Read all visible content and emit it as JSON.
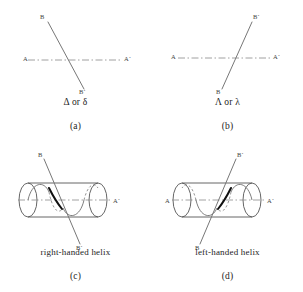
{
  "figure": {
    "domain": "diagram",
    "type": "chirality-convention-figure",
    "background": "#ffffff",
    "stroke_color": "#555555",
    "dash_color": "#777777",
    "bold_color": "#111111",
    "text_color": "#1d1d1d",
    "panels": [
      {
        "id": "a",
        "caption_name": "Δ or δ",
        "caption_letter": "(a)",
        "kind": "skew-lines",
        "labels": {
          "axis_left": "A",
          "axis_right": "A´",
          "line_top": "B",
          "line_bottom": "B´"
        },
        "description": "front line descends left-to-right over a horizontal dashed A-A´ axis"
      },
      {
        "id": "b",
        "caption_name": "Λ or λ",
        "caption_letter": "(b)",
        "kind": "skew-lines",
        "labels": {
          "axis_left": "A",
          "axis_right": "A´",
          "line_top": "B´",
          "line_bottom": "B"
        },
        "description": "front line ascends left-to-right over a horizontal dashed A-A´ axis"
      },
      {
        "id": "c",
        "caption_name": "right-handed helix",
        "caption_letter": "(c)",
        "kind": "cylinder-helix",
        "handedness": "right",
        "labels": {
          "axis_left": "A",
          "axis_right": "A´",
          "line_top": "B",
          "line_bottom": "B´"
        },
        "description": "helix drawn on a cylinder with dashed hidden back arcs and a bold front segment"
      },
      {
        "id": "d",
        "caption_name": "left-handed helix",
        "caption_letter": "(d)",
        "kind": "cylinder-helix",
        "handedness": "left",
        "labels": {
          "axis_left": "A",
          "axis_right": "A´",
          "line_top": "B´",
          "line_bottom": "B"
        },
        "description": "mirror-image helix on a cylinder with dashed hidden back arcs and a bold front segment"
      }
    ]
  }
}
